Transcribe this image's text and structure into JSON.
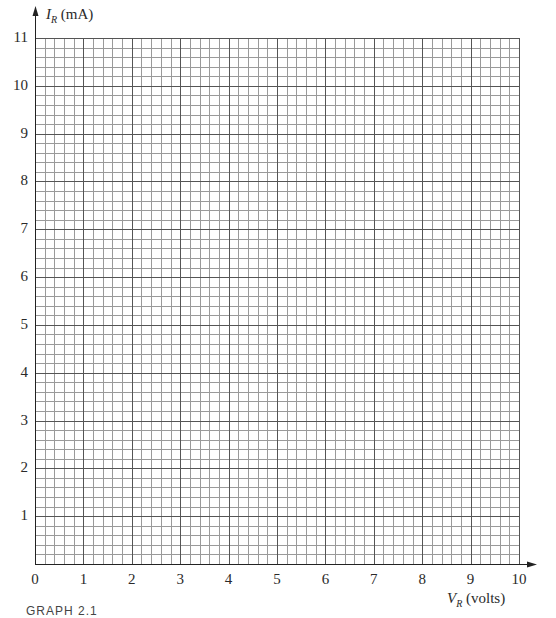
{
  "chart_data": {
    "type": "scatter",
    "title": "",
    "xlabel": "V_R (volts)",
    "ylabel": "I_R (mA)",
    "x_axis": {
      "var": "V",
      "sub": "R",
      "unit": "(volts)",
      "range": [
        0,
        10
      ],
      "ticks": [
        "0",
        "1",
        "2",
        "3",
        "4",
        "5",
        "6",
        "7",
        "8",
        "9",
        "10"
      ],
      "minor_per_major": 5
    },
    "y_axis": {
      "var": "I",
      "sub": "R",
      "unit": "(mA)",
      "range": [
        0,
        11
      ],
      "ticks": [
        "1",
        "2",
        "3",
        "4",
        "5",
        "6",
        "7",
        "8",
        "9",
        "10",
        "11"
      ],
      "minor_per_major": 5
    },
    "grid": true,
    "series": [],
    "legend": null,
    "note": "Blank graph paper grid for plotting I_R versus V_R"
  },
  "caption": "GRAPH 2.1",
  "style": {
    "major_grid_color": "#555555",
    "minor_grid_color": "#9a9a9a",
    "axis_color": "#222222"
  }
}
